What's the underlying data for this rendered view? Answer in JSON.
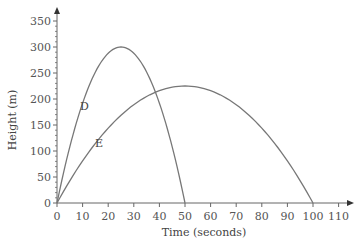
{
  "chart_data": {
    "type": "line",
    "title": "",
    "xlabel": "Time (seconds)",
    "ylabel": "Height (m)",
    "xlim": [
      0,
      110
    ],
    "ylim": [
      0,
      350
    ],
    "x_ticks": [
      0,
      10,
      20,
      30,
      40,
      50,
      60,
      70,
      80,
      90,
      100,
      110
    ],
    "y_ticks": [
      0,
      50,
      100,
      150,
      200,
      250,
      300,
      350
    ],
    "grid": false,
    "legend": "inline labels",
    "series": [
      {
        "name": "D",
        "shape": "parabola",
        "x": [
          0,
          5,
          10,
          15,
          20,
          25,
          30,
          35,
          40,
          45,
          50
        ],
        "values": [
          0,
          108,
          192,
          252,
          288,
          300,
          288,
          252,
          192,
          108,
          0
        ],
        "peak": {
          "x": 25,
          "y": 300
        },
        "color": "#777777"
      },
      {
        "name": "E",
        "shape": "parabola",
        "x": [
          0,
          10,
          20,
          30,
          40,
          50,
          60,
          70,
          80,
          90,
          100
        ],
        "values": [
          0,
          81,
          144,
          189,
          216,
          225,
          216,
          189,
          144,
          81,
          0
        ],
        "peak": {
          "x": 50,
          "y": 225
        },
        "color": "#777777"
      }
    ]
  },
  "labels": {
    "xlabel": "Time (seconds)",
    "ylabel": "Height (m)",
    "series_d": "D",
    "series_e": "E",
    "x_ticks": [
      "0",
      "10",
      "20",
      "30",
      "40",
      "50",
      "60",
      "70",
      "80",
      "90",
      "100",
      "110"
    ],
    "y_ticks": [
      "0",
      "50",
      "100",
      "150",
      "200",
      "250",
      "300",
      "350"
    ]
  }
}
